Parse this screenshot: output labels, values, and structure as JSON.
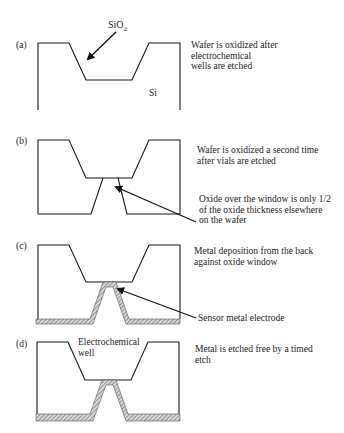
{
  "figure": {
    "panels": [
      {
        "id": "a",
        "label": "(a)",
        "description_lines": [
          "Wafer is oxidized after",
          "electrochemical",
          "wells are etched"
        ],
        "annotations": {
          "oxide_label": "SiO",
          "oxide_subscript": "2",
          "silicon_label": "Si"
        }
      },
      {
        "id": "b",
        "label": "(b)",
        "description_lines": [
          "Wafer is oxidized a second time",
          "after vials are etched"
        ],
        "callout_lines": [
          "Oxide over the window is only 1/2",
          "of the oxide thickness elsewhere",
          "on the wafer"
        ]
      },
      {
        "id": "c",
        "label": "(c)",
        "description_lines": [
          "Metal deposition from the back",
          "against oxide window"
        ],
        "callout_lines": [
          "Sensor metal electrode"
        ]
      },
      {
        "id": "d",
        "label": "(d)",
        "description_lines": [
          "Metal is etched free by a timed",
          "etch"
        ],
        "annotations": {
          "well_label_line1": "Electrochemical",
          "well_label_line2": "well"
        }
      }
    ]
  },
  "colors": {
    "line": "#1a1a1a",
    "hatch": "#777777",
    "background": "#ffffff"
  }
}
